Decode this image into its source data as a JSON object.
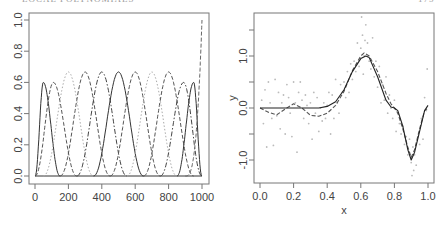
{
  "header": {
    "left_running_head": "LOCAL POLYNOMIALS",
    "right_page_number": "175"
  },
  "chart_data": [
    {
      "type": "line",
      "title": "",
      "xlabel": "",
      "ylabel": "",
      "xlim": [
        0,
        1000
      ],
      "ylim": [
        0,
        1.0
      ],
      "xticks": [
        0,
        200,
        400,
        600,
        800,
        1000
      ],
      "xtick_labels": [
        "0",
        "200",
        "400",
        "600",
        "800",
        "1000"
      ],
      "yticks": [
        0.0,
        0.2,
        0.4,
        0.6,
        0.8,
        1.0
      ],
      "ytick_labels": [
        "0.0",
        "0.2",
        "0.4",
        "0.6",
        "0.8",
        "1.0"
      ],
      "grid": false,
      "legend": null,
      "description": "Cubic B-spline basis functions on [0,1000]",
      "series": [
        {
          "name": "basis-1",
          "peak_x": 50,
          "peak_y": 0.6,
          "left": 0,
          "right": 150,
          "style": "solid",
          "color": "#333333"
        },
        {
          "name": "basis-2",
          "peak_x": 110,
          "peak_y": 0.6,
          "left": 0,
          "right": 250,
          "style": "dashed",
          "color": "#555555"
        },
        {
          "name": "basis-3",
          "peak_x": 200,
          "peak_y": 0.667,
          "left": 50,
          "right": 350,
          "style": "dotted",
          "color": "#aaaaaa"
        },
        {
          "name": "basis-4",
          "peak_x": 300,
          "peak_y": 0.667,
          "left": 150,
          "right": 450,
          "style": "dashed",
          "color": "#555555"
        },
        {
          "name": "basis-5",
          "peak_x": 400,
          "peak_y": 0.667,
          "left": 250,
          "right": 550,
          "style": "dashdot",
          "color": "#444444"
        },
        {
          "name": "basis-6",
          "peak_x": 500,
          "peak_y": 0.667,
          "left": 350,
          "right": 650,
          "style": "solid",
          "color": "#333333"
        },
        {
          "name": "basis-7",
          "peak_x": 600,
          "peak_y": 0.667,
          "left": 450,
          "right": 750,
          "style": "dashed",
          "color": "#555555"
        },
        {
          "name": "basis-8",
          "peak_x": 700,
          "peak_y": 0.667,
          "left": 550,
          "right": 850,
          "style": "dotted",
          "color": "#aaaaaa"
        },
        {
          "name": "basis-9",
          "peak_x": 800,
          "peak_y": 0.667,
          "left": 650,
          "right": 950,
          "style": "dashed",
          "color": "#555555"
        },
        {
          "name": "basis-10",
          "peak_x": 890,
          "peak_y": 0.6,
          "left": 750,
          "right": 1000,
          "style": "dashdot",
          "color": "#444444"
        },
        {
          "name": "basis-11",
          "peak_x": 950,
          "peak_y": 0.6,
          "left": 850,
          "right": 1000,
          "style": "solid",
          "color": "#333333"
        },
        {
          "name": "basis-12",
          "peak_x": 1000,
          "peak_y": 1.0,
          "left": 900,
          "right": 1000,
          "style": "dashed",
          "color": "#666666"
        }
      ],
      "baseline": {
        "y": 0.0,
        "style": "solid"
      }
    },
    {
      "type": "scatter",
      "title": "",
      "xlabel": "x",
      "ylabel": "y",
      "xlim": [
        0,
        1.0
      ],
      "ylim": [
        -1.4,
        1.8
      ],
      "xticks": [
        0.0,
        0.2,
        0.4,
        0.6,
        0.8,
        1.0
      ],
      "xtick_labels": [
        "0.0",
        "0.2",
        "0.4",
        "0.6",
        "0.8",
        "1.0"
      ],
      "yticks": [
        -1.0,
        -0.5,
        0.0,
        0.5,
        1.0,
        1.5
      ],
      "ytick_labels": [
        "-1.0",
        "",
        "0.0",
        "",
        "1.0",
        ""
      ],
      "grid": false,
      "legend": null,
      "series": [
        {
          "name": "true-function",
          "style": "solid",
          "color": "#222222",
          "x": [
            0.0,
            0.05,
            0.1,
            0.15,
            0.2,
            0.25,
            0.3,
            0.35,
            0.4,
            0.45,
            0.5,
            0.55,
            0.6,
            0.63,
            0.65,
            0.7,
            0.75,
            0.78,
            0.8,
            0.82,
            0.85,
            0.88,
            0.9,
            0.92,
            0.95,
            0.98,
            1.0
          ],
          "y": [
            0.0,
            0.0,
            0.0,
            0.0,
            0.0,
            0.0,
            0.0,
            0.0,
            0.03,
            0.12,
            0.35,
            0.7,
            0.95,
            1.0,
            0.97,
            0.6,
            0.15,
            0.02,
            0.0,
            -0.05,
            -0.35,
            -0.8,
            -1.0,
            -0.85,
            -0.45,
            -0.05,
            0.05
          ]
        },
        {
          "name": "spline-fit",
          "style": "dashed",
          "color": "#555555",
          "x": [
            0.0,
            0.05,
            0.1,
            0.15,
            0.2,
            0.25,
            0.3,
            0.35,
            0.4,
            0.45,
            0.5,
            0.55,
            0.6,
            0.62,
            0.65,
            0.7,
            0.75,
            0.78,
            0.8,
            0.82,
            0.85,
            0.88,
            0.9,
            0.92,
            0.95,
            0.98,
            1.0
          ],
          "y": [
            0.0,
            -0.08,
            -0.13,
            -0.02,
            0.08,
            0.0,
            -0.14,
            -0.16,
            -0.1,
            0.05,
            0.32,
            0.72,
            1.0,
            1.06,
            1.0,
            0.7,
            0.28,
            0.08,
            0.0,
            -0.1,
            -0.4,
            -0.75,
            -0.95,
            -0.8,
            -0.4,
            -0.05,
            0.0
          ]
        },
        {
          "name": "data-points",
          "style": "points",
          "color": "#bbbbbb",
          "x": [
            0.01,
            0.02,
            0.03,
            0.04,
            0.05,
            0.06,
            0.07,
            0.08,
            0.09,
            0.1,
            0.11,
            0.12,
            0.13,
            0.14,
            0.15,
            0.16,
            0.17,
            0.18,
            0.19,
            0.2,
            0.21,
            0.22,
            0.23,
            0.24,
            0.25,
            0.26,
            0.27,
            0.28,
            0.29,
            0.3,
            0.31,
            0.32,
            0.33,
            0.34,
            0.35,
            0.36,
            0.37,
            0.38,
            0.39,
            0.4,
            0.41,
            0.42,
            0.43,
            0.44,
            0.45,
            0.46,
            0.47,
            0.48,
            0.49,
            0.5,
            0.51,
            0.52,
            0.53,
            0.54,
            0.55,
            0.56,
            0.57,
            0.58,
            0.59,
            0.6,
            0.605,
            0.61,
            0.615,
            0.62,
            0.625,
            0.63,
            0.64,
            0.65,
            0.66,
            0.67,
            0.68,
            0.69,
            0.7,
            0.71,
            0.72,
            0.73,
            0.74,
            0.75,
            0.76,
            0.77,
            0.78,
            0.79,
            0.8,
            0.81,
            0.82,
            0.83,
            0.84,
            0.85,
            0.86,
            0.87,
            0.88,
            0.89,
            0.9,
            0.905,
            0.91,
            0.915,
            0.92,
            0.93,
            0.94,
            0.95,
            0.96,
            0.97,
            0.98,
            0.99,
            0.995
          ],
          "y": [
            0.15,
            -0.3,
            0.35,
            -0.75,
            0.5,
            0.1,
            -0.2,
            -0.72,
            0.55,
            -0.15,
            0.3,
            -0.4,
            0.1,
            0.25,
            -0.5,
            0.45,
            0.2,
            -0.1,
            -0.55,
            0.5,
            0.1,
            -0.85,
            0.3,
            0.5,
            0.15,
            -0.2,
            0.25,
            0.05,
            -0.3,
            0.1,
            -0.6,
            0.3,
            -0.1,
            0.2,
            -0.45,
            0.0,
            -0.25,
            0.1,
            -0.2,
            0.05,
            0.3,
            -0.5,
            0.25,
            -0.2,
            0.55,
            0.1,
            -0.1,
            0.45,
            0.3,
            0.5,
            0.2,
            0.7,
            0.3,
            0.85,
            0.55,
            0.9,
            0.7,
            1.25,
            0.8,
            1.15,
            1.75,
            1.4,
            0.65,
            1.0,
            1.3,
            1.6,
            1.25,
            0.9,
            0.75,
            1.35,
            0.6,
            0.9,
            0.4,
            0.8,
            0.1,
            0.45,
            0.15,
            0.6,
            -0.1,
            0.25,
            0.0,
            -0.2,
            0.15,
            -0.45,
            -0.1,
            -0.3,
            -0.5,
            -0.35,
            -0.7,
            -0.55,
            -0.9,
            -0.6,
            -1.05,
            -1.3,
            -0.75,
            -1.2,
            -0.9,
            -1.1,
            -0.55,
            -0.7,
            -0.2,
            -0.6,
            0.2,
            -0.05,
            0.75
          ]
        }
      ]
    }
  ]
}
